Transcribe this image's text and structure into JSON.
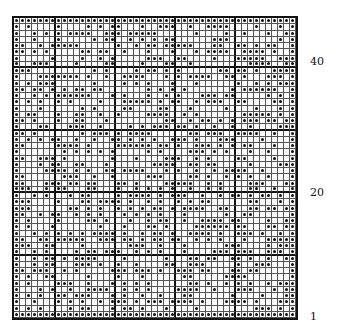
{
  "chart": {
    "title": "",
    "columns": 47,
    "rows": 48,
    "major_every": 10,
    "dot_color": "#111111",
    "line_color": "#555555"
  },
  "row_labels": [
    {
      "text": "40",
      "row": 40
    },
    {
      "text": "20",
      "row": 20
    },
    {
      "text": "1",
      "row": 1
    }
  ]
}
